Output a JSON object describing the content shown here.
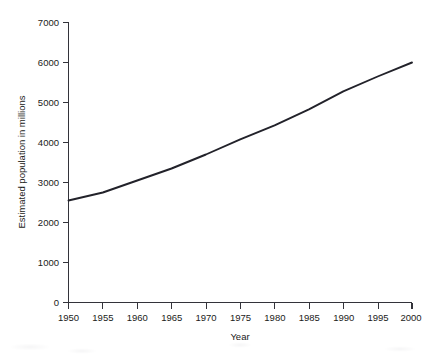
{
  "chart_data": {
    "type": "line",
    "title": "",
    "xlabel": "Year",
    "ylabel": "Estimated population in millions",
    "x": [
      1950,
      1955,
      1960,
      1965,
      1970,
      1975,
      1980,
      1985,
      1990,
      1995,
      2000
    ],
    "values": [
      2550,
      2750,
      3050,
      3350,
      3700,
      4080,
      4430,
      4830,
      5280,
      5650,
      6000
    ],
    "series": [
      {
        "name": "Estimated world population",
        "values": [
          2550,
          2750,
          3050,
          3350,
          3700,
          4080,
          4430,
          4830,
          5280,
          5650,
          6000
        ]
      }
    ],
    "xlim": [
      1950,
      2000
    ],
    "ylim": [
      0,
      7000
    ],
    "x_ticks": [
      "1950",
      "1955",
      "1960",
      "1965",
      "1970",
      "1975",
      "1980",
      "1985",
      "1990",
      "1995",
      "2000"
    ],
    "y_ticks": [
      "0",
      "1000",
      "2000",
      "3000",
      "4000",
      "5000",
      "6000",
      "7000"
    ],
    "y_tick_values": [
      0,
      1000,
      2000,
      3000,
      4000,
      5000,
      6000,
      7000
    ],
    "grid": false,
    "legend": "none",
    "line_color": "#22222a",
    "axis_color": "#33333a"
  },
  "scan": {
    "top_artifact_text": ""
  }
}
